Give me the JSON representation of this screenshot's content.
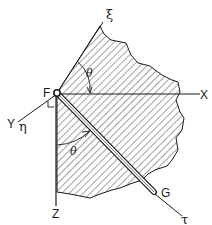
{
  "figure": {
    "type": "mechanics-coordinate-diagram",
    "colors": {
      "line": "#1a1a1a",
      "hatch": "#333333",
      "background": "#ffffff"
    }
  },
  "labels": {
    "xi": "ξ",
    "x_axis": "X",
    "y_axis": "Y",
    "eta": "η",
    "z_axis": "Z",
    "tau": "τ",
    "point_f": "F",
    "point_g": "G",
    "theta_top": "θ",
    "theta_bottom": "θ"
  }
}
